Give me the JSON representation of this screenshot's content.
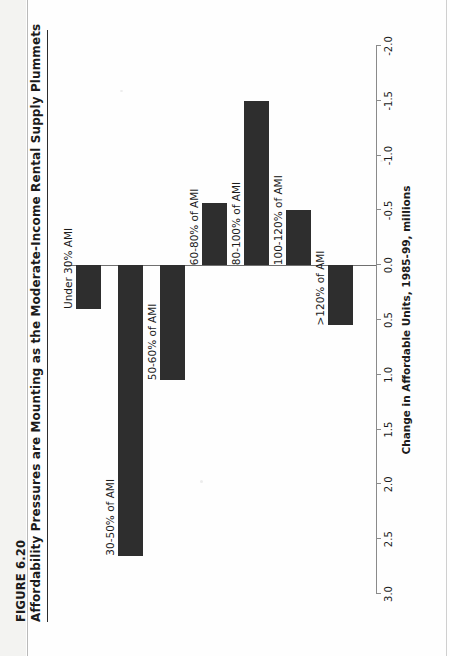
{
  "figure": {
    "number": "FIGURE 6.20",
    "title": "Affordability Pressures are Mounting as the Moderate-Income Rental Supply Plummets"
  },
  "axis": {
    "title": "Change in Affordable Units, 1985-99, millions",
    "ticks": [
      "3.0",
      "2.5",
      "2.0",
      "1.5",
      "1.0",
      "0.5",
      "0.0",
      "-0.5",
      "-1.0",
      "-1.5",
      "-2.0"
    ]
  },
  "colors": {
    "bar": "#2e2e2e",
    "axis": "#8a8a8a",
    "zero_line": "#6f6f6f",
    "text": "#1b1b1b",
    "page": "#ffffff"
  },
  "chart_data": {
    "type": "bar",
    "orientation": "horizontal",
    "title": "Affordability Pressures are Mounting as the Moderate-Income Rental Supply Plummets",
    "xlabel": "Change in Affordable Units, 1985-99, millions",
    "ylabel": "",
    "categories": [
      "Under 30% AMI",
      "30-50% of AMI",
      "50-60% of AMI",
      "60-80% of AMI",
      "80-100% of AMI",
      "100-120% of AMI",
      ">120% of AMI"
    ],
    "values": [
      0.4,
      2.65,
      1.05,
      -0.57,
      -1.5,
      -0.5,
      0.55
    ],
    "xlim": [
      3.0,
      -2.0
    ],
    "xticks": [
      3.0,
      2.5,
      2.0,
      1.5,
      1.0,
      0.5,
      0.0,
      -0.5,
      -1.0,
      -1.5,
      -2.0
    ],
    "grid": false,
    "legend": false
  }
}
